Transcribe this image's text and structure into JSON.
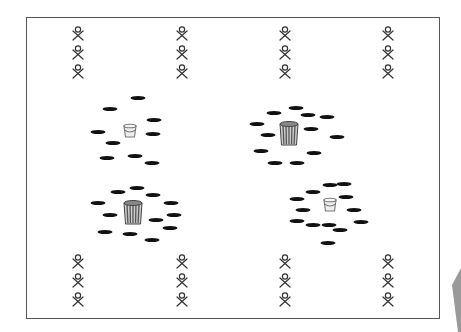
{
  "diagram": {
    "type": "sports-drill-layout",
    "frame": {
      "x": 26,
      "y": 17,
      "width": 415,
      "height": 303,
      "stroke": "#555555"
    },
    "colors": {
      "disc": "#111111",
      "figure": "#333333",
      "bucket": "#777777",
      "barrel_fill": "#cccccc",
      "barrel_stripe": "#555555",
      "wedge": "#9a9a9a"
    },
    "players": {
      "columns_x": [
        78,
        182,
        285,
        388
      ],
      "top_rows_y": [
        34,
        53,
        72
      ],
      "bottom_rows_y": [
        262,
        281,
        300
      ]
    },
    "stations": [
      {
        "name": "top-left",
        "container": {
          "kind": "bucket",
          "x": 130,
          "y": 131
        },
        "discs": [
          [
            138,
            98
          ],
          [
            110,
            109
          ],
          [
            154,
            120
          ],
          [
            98,
            132
          ],
          [
            153,
            134
          ],
          [
            113,
            143
          ],
          [
            107,
            158
          ],
          [
            135,
            156
          ],
          [
            152,
            163
          ]
        ]
      },
      {
        "name": "top-right",
        "container": {
          "kind": "barrel",
          "x": 289,
          "y": 134
        },
        "discs": [
          [
            296,
            108
          ],
          [
            274,
            113
          ],
          [
            308,
            115
          ],
          [
            327,
            117
          ],
          [
            257,
            124
          ],
          [
            268,
            135
          ],
          [
            311,
            129
          ],
          [
            337,
            137
          ],
          [
            261,
            151
          ],
          [
            314,
            153
          ],
          [
            275,
            163
          ],
          [
            297,
            163
          ]
        ]
      },
      {
        "name": "bottom-left",
        "container": {
          "kind": "barrel",
          "x": 133,
          "y": 213
        },
        "discs": [
          [
            118,
            192
          ],
          [
            137,
            188
          ],
          [
            153,
            195
          ],
          [
            98,
            203
          ],
          [
            171,
            203
          ],
          [
            110,
            215
          ],
          [
            174,
            215
          ],
          [
            156,
            220
          ],
          [
            105,
            232
          ],
          [
            130,
            234
          ],
          [
            170,
            228
          ],
          [
            152,
            240
          ]
        ]
      },
      {
        "name": "bottom-right",
        "container": {
          "kind": "bucket",
          "x": 330,
          "y": 205
        },
        "discs": [
          [
            330,
            185
          ],
          [
            344,
            184
          ],
          [
            313,
            192
          ],
          [
            346,
            197
          ],
          [
            297,
            199
          ],
          [
            303,
            210
          ],
          [
            354,
            210
          ],
          [
            297,
            221
          ],
          [
            313,
            225
          ],
          [
            329,
            225
          ],
          [
            340,
            230
          ],
          [
            361,
            222
          ],
          [
            328,
            243
          ]
        ]
      }
    ],
    "wedge": {
      "points": "452,285 461,268 461,332 458,332"
    }
  }
}
